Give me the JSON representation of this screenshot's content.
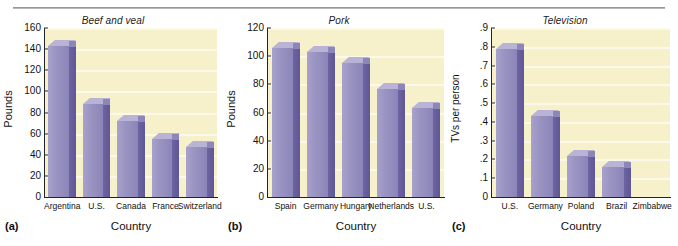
{
  "figure": {
    "background_color": "#ffffff",
    "plot_background_color": "#f6f0cb",
    "bar_front_color": "#9b95c3",
    "bar_side_color": "#655d9c",
    "bar_top_color": "#b9b3d6",
    "axis_color": "#242424",
    "rule_color": "#9a9a9a"
  },
  "panels": [
    {
      "letter": "(a)",
      "title": "Beef and veal",
      "ylabel": "Pounds",
      "xlabel": "Country"
    },
    {
      "letter": "(b)",
      "title": "Pork",
      "ylabel": "Pounds",
      "xlabel": "Country"
    },
    {
      "letter": "(c)",
      "title": "Television",
      "ylabel": "TVs per person",
      "xlabel": "Country"
    }
  ],
  "chart_data": [
    {
      "type": "bar",
      "title": "Beef and veal",
      "xlabel": "Country",
      "ylabel": "Pounds",
      "categories": [
        "Argentina",
        "U.S.",
        "Canada",
        "France",
        "Switzerland"
      ],
      "values": [
        143,
        88,
        72,
        55,
        47
      ],
      "ylim": [
        0,
        160
      ],
      "yticks": [
        0,
        20,
        40,
        60,
        80,
        100,
        120,
        140,
        160
      ],
      "ytick_labels": [
        "0",
        "20",
        "40",
        "60",
        "80",
        "100",
        "120",
        "140",
        "160"
      ],
      "grid": true,
      "legend": false
    },
    {
      "type": "bar",
      "title": "Pork",
      "xlabel": "Country",
      "ylabel": "Pounds",
      "categories": [
        "Spain",
        "Germany",
        "Hungary",
        "Netherlands",
        "U.S."
      ],
      "values": [
        106,
        103,
        95,
        77,
        63
      ],
      "ylim": [
        0,
        120
      ],
      "yticks": [
        0,
        20,
        40,
        60,
        80,
        100,
        120
      ],
      "ytick_labels": [
        "0",
        "20",
        "40",
        "60",
        "80",
        "100",
        "120"
      ],
      "grid": true,
      "legend": false
    },
    {
      "type": "bar",
      "title": "Television",
      "xlabel": "Country",
      "ylabel": "TVs per person",
      "categories": [
        "U.S.",
        "Germany",
        "Poland",
        "Brazil",
        "Zimbabwe"
      ],
      "values": [
        0.79,
        0.43,
        0.22,
        0.16,
        0.0
      ],
      "ylim": [
        0,
        0.9
      ],
      "yticks": [
        0,
        0.1,
        0.2,
        0.3,
        0.4,
        0.5,
        0.6,
        0.7,
        0.8,
        0.9
      ],
      "ytick_labels": [
        "0",
        ".1",
        ".2",
        ".3",
        ".4",
        ".5",
        ".6",
        ".7",
        ".8",
        ".9"
      ],
      "grid": true,
      "legend": false
    }
  ]
}
